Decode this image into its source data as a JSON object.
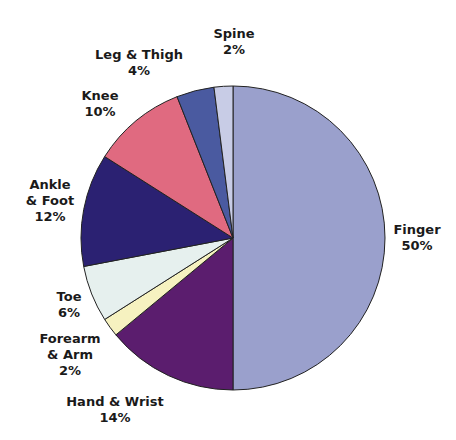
{
  "chart_data": {
    "type": "pie",
    "title": "",
    "start_angle_deg": 0,
    "direction": "clockwise",
    "slices": [
      {
        "label": "Finger",
        "value": 50,
        "display": "50%",
        "color": "#9aa0cc"
      },
      {
        "label": "Hand & Wrist",
        "value": 14,
        "display": "14%",
        "color": "#5b1d6e"
      },
      {
        "label": "Forearm & Arm",
        "value": 2,
        "display": "2%",
        "color": "#f6f2c0"
      },
      {
        "label": "Toe",
        "value": 6,
        "display": "6%",
        "color": "#e6f0ee"
      },
      {
        "label": "Ankle & Foot",
        "value": 12,
        "display": "12%",
        "color": "#2b2172"
      },
      {
        "label": "Knee",
        "value": 10,
        "display": "10%",
        "color": "#e06a80"
      },
      {
        "label": "Leg & Thigh",
        "value": 4,
        "display": "4%",
        "color": "#4a5aa0"
      },
      {
        "label": "Spine",
        "value": 2,
        "display": "2%",
        "color": "#c8cce6"
      }
    ]
  },
  "labels": {
    "finger": {
      "line1": "Finger",
      "line2": "50%"
    },
    "hand_wrist": {
      "line1": "Hand & Wrist",
      "line2": "14%"
    },
    "forearm_arm": {
      "line1": "Forearm",
      "line2": "& Arm",
      "line3": "2%"
    },
    "toe": {
      "line1": "Toe",
      "line2": "6%"
    },
    "ankle_foot": {
      "line1": "Ankle",
      "line2": "& Foot",
      "line3": "12%"
    },
    "knee": {
      "line1": "Knee",
      "line2": "10%"
    },
    "leg_thigh": {
      "line1": "Leg & Thigh",
      "line2": "4%"
    },
    "spine": {
      "line1": "Spine",
      "line2": "2%"
    }
  }
}
